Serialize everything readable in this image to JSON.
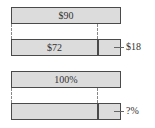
{
  "diagram": {
    "type": "tape-diagram",
    "groups": [
      {
        "whole_bar": {
          "label": "$90"
        },
        "part_bar": {
          "left_label": "$72",
          "right_label": "$18"
        }
      },
      {
        "whole_bar": {
          "label": "100%"
        },
        "part_bar": {
          "left_label": "",
          "right_label": "?%"
        }
      }
    ],
    "colors": {
      "bar_fill": "#dcdcdc",
      "bar_border": "#4a4a4a",
      "dash": "#888888"
    }
  }
}
